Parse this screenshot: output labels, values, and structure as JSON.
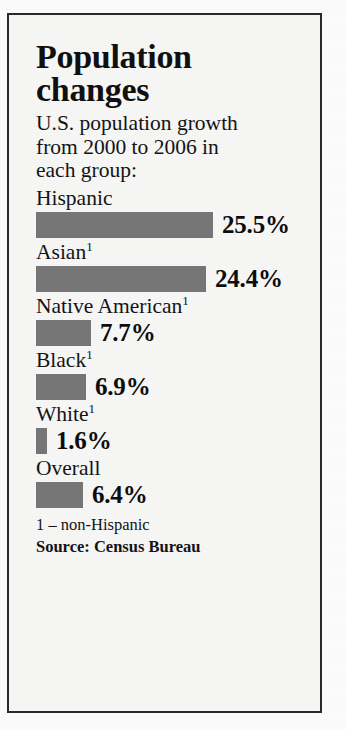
{
  "title": "Population\nchanges",
  "subtitle": "U.S. population growth\nfrom 2000 to 2006 in\neach group:",
  "footnotes": {
    "note": "1 – non-Hispanic",
    "source": "Source: Census Bureau"
  },
  "colors": {
    "bar": "#767676",
    "text": "#141414",
    "frame": "#2a2a2a",
    "background": "#f6f6f5"
  },
  "chart_data": {
    "type": "bar",
    "title": "Population changes",
    "subtitle": "U.S. population growth from 2000 to 2006 in each group:",
    "orientation": "horizontal",
    "xlabel": "",
    "ylabel": "",
    "xlim": [
      0,
      25.5
    ],
    "grid": false,
    "legend": null,
    "unit": "percent",
    "categories": [
      "Hispanic",
      "Asian",
      "Native American",
      "Black",
      "White",
      "Overall"
    ],
    "values": [
      25.5,
      24.4,
      7.7,
      6.9,
      1.6,
      6.4
    ],
    "value_labels": [
      "25.5%",
      "24.4%",
      "7.7%",
      "6.9%",
      "1.6%",
      "6.4%"
    ],
    "bars": [
      {
        "label": "Hispanic",
        "footnote": "",
        "value": 25.5,
        "value_label": "25.5%",
        "bar_px": 177
      },
      {
        "label": "Asian",
        "footnote": "1",
        "value": 24.4,
        "value_label": "24.4%",
        "bar_px": 170
      },
      {
        "label": "Native American",
        "footnote": "1",
        "value": 7.7,
        "value_label": "7.7%",
        "bar_px": 55
      },
      {
        "label": "Black",
        "footnote": "1",
        "value": 6.9,
        "value_label": "6.9%",
        "bar_px": 50
      },
      {
        "label": "White",
        "footnote": "1",
        "value": 1.6,
        "value_label": "1.6%",
        "bar_px": 11
      },
      {
        "label": "Overall",
        "footnote": "",
        "value": 6.4,
        "value_label": "6.4%",
        "bar_px": 47
      }
    ],
    "annotations": [
      "1 – non-Hispanic",
      "Source: Census Bureau"
    ]
  }
}
